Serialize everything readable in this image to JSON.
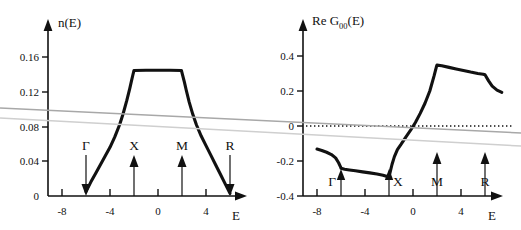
{
  "figure": {
    "panels": [
      {
        "id": "dos",
        "title": "n(E)",
        "xlabel": "E",
        "yticks": [
          "0.16",
          "0.12",
          "0.08",
          "0.04",
          "0"
        ],
        "ytick_values": [
          0.16,
          0.12,
          0.08,
          0.04,
          0
        ],
        "xticks": [
          "-8",
          "-4",
          "0",
          "4"
        ],
        "xtick_values": [
          -8,
          -4,
          0,
          4
        ],
        "symbols": [
          {
            "label": "Γ",
            "x": -6,
            "direction": "down"
          },
          {
            "label": "X",
            "x": -2,
            "direction": "up"
          },
          {
            "label": "M",
            "x": 2,
            "direction": "up"
          },
          {
            "label": "R",
            "x": 6,
            "direction": "down"
          }
        ]
      },
      {
        "id": "reg00",
        "title_main": "Re G",
        "title_sub": "00",
        "title_tail": "(E)",
        "xlabel": "E",
        "yticks": [
          "0.4",
          "0.2",
          "0",
          "-0.2",
          "-0.4"
        ],
        "ytick_values": [
          0.4,
          0.2,
          0,
          -0.2,
          -0.4
        ],
        "xticks": [
          "-8",
          "-4",
          "0",
          "4"
        ],
        "xtick_values": [
          -8,
          -4,
          0,
          4
        ],
        "symbols": [
          {
            "label": "Γ",
            "x": -6,
            "direction": "up"
          },
          {
            "label": "X",
            "x": -2,
            "direction": "up"
          },
          {
            "label": "M",
            "x": 2,
            "direction": "up"
          },
          {
            "label": "R",
            "x": 6,
            "direction": "up"
          }
        ]
      }
    ],
    "colors": {
      "ink": "#111111",
      "scan_line_dark": "#a8a8a8",
      "scan_line_light": "#cfcfcf",
      "background": "#ffffff"
    }
  },
  "chart_data": [
    {
      "type": "line",
      "id": "dos",
      "title": "n(E)",
      "xlabel": "E",
      "ylabel": "n(E)",
      "xlim": [
        -8.8,
        7.6
      ],
      "ylim": [
        0,
        0.178
      ],
      "grid": false,
      "legend": "none",
      "annotations": [
        {
          "text": "Γ",
          "x": -6,
          "arrow": "down"
        },
        {
          "text": "X",
          "x": -2,
          "arrow": "up"
        },
        {
          "text": "M",
          "x": 2,
          "arrow": "up"
        },
        {
          "text": "R",
          "x": 6,
          "arrow": "down"
        }
      ],
      "x": [
        -6.0,
        -5.6,
        -5.2,
        -4.8,
        -4.4,
        -4.0,
        -3.6,
        -3.2,
        -2.9,
        -2.6,
        -2.35,
        -2.2,
        -2.1,
        -2.0,
        -1.0,
        0.0,
        1.0,
        1.95,
        2.05,
        2.2,
        2.35,
        2.6,
        2.9,
        3.2,
        3.6,
        4.0,
        4.4,
        4.8,
        5.2,
        5.6,
        6.0
      ],
      "y": [
        0.005,
        0.016,
        0.026,
        0.036,
        0.046,
        0.056,
        0.068,
        0.082,
        0.095,
        0.11,
        0.124,
        0.133,
        0.139,
        0.1445,
        0.1448,
        0.1448,
        0.1448,
        0.1445,
        0.139,
        0.131,
        0.122,
        0.108,
        0.094,
        0.082,
        0.069,
        0.058,
        0.047,
        0.036,
        0.025,
        0.014,
        0.003
      ]
    },
    {
      "type": "line",
      "id": "reg00",
      "title": "Re G00(E)",
      "xlabel": "E",
      "ylabel": "Re G00(E)",
      "xlim": [
        -8.8,
        7.6
      ],
      "ylim": [
        -0.44,
        0.5
      ],
      "grid": false,
      "legend": "none",
      "zero_reference_line": 0,
      "annotations": [
        {
          "text": "Γ",
          "x": -6,
          "arrow": "up"
        },
        {
          "text": "X",
          "x": -2,
          "arrow": "up"
        },
        {
          "text": "M",
          "x": 2,
          "arrow": "up"
        },
        {
          "text": "R",
          "x": 6,
          "arrow": "up"
        }
      ],
      "x": [
        -8.0,
        -7.6,
        -7.2,
        -6.8,
        -6.45,
        -6.2,
        -6.05,
        -6.0,
        -5.7,
        -5.3,
        -4.8,
        -4.2,
        -3.6,
        -3.0,
        -2.5,
        -2.15,
        -2.0,
        -1.9,
        -1.75,
        -1.55,
        -1.3,
        -1.0,
        -0.6,
        -0.2,
        0.2,
        0.6,
        1.0,
        1.4,
        1.75,
        1.95,
        2.0,
        2.4,
        3.0,
        3.6,
        4.2,
        4.8,
        5.4,
        5.85,
        6.0,
        6.3,
        6.6,
        7.0,
        7.4
      ],
      "y": [
        -0.132,
        -0.14,
        -0.15,
        -0.163,
        -0.182,
        -0.21,
        -0.232,
        -0.242,
        -0.247,
        -0.251,
        -0.256,
        -0.262,
        -0.268,
        -0.274,
        -0.281,
        -0.288,
        -0.291,
        -0.262,
        -0.22,
        -0.175,
        -0.135,
        -0.105,
        -0.063,
        -0.024,
        0.02,
        0.072,
        0.13,
        0.2,
        0.285,
        0.338,
        0.348,
        0.344,
        0.335,
        0.326,
        0.317,
        0.308,
        0.3,
        0.296,
        0.293,
        0.258,
        0.228,
        0.205,
        0.192
      ]
    }
  ]
}
